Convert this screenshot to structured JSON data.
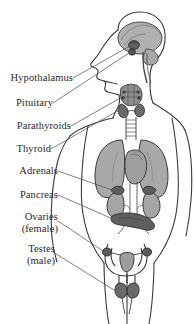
{
  "diagram": {
    "type": "anatomical-diagram",
    "view": "human body, front view with left-facing profile head",
    "style": "grayscale line drawing with shaded organs",
    "colors": {
      "background": "#ffffff",
      "outline": "#3a3a3a",
      "leader_line": "#555555",
      "text": "#2b2b2b",
      "organ_light": "#b5b5b5",
      "organ_mid": "#9a9a9a",
      "organ_dark": "#6e6e6e",
      "organ_darkest": "#5a5a5a"
    },
    "labels": [
      {
        "id": "hypothalamus",
        "text": "Hypothalamus",
        "sub": ""
      },
      {
        "id": "pituitary",
        "text": "Pituitary",
        "sub": ""
      },
      {
        "id": "parathyroids",
        "text": "Parathyroids",
        "sub": ""
      },
      {
        "id": "thyroid",
        "text": "Thyroid",
        "sub": ""
      },
      {
        "id": "adrenals",
        "text": "Adrenals",
        "sub": ""
      },
      {
        "id": "pancreas",
        "text": "Pancreas",
        "sub": ""
      },
      {
        "id": "ovaries",
        "text": "Ovaries",
        "sub": "(female)"
      },
      {
        "id": "testes",
        "text": "Testes",
        "sub": "(male)"
      }
    ]
  }
}
